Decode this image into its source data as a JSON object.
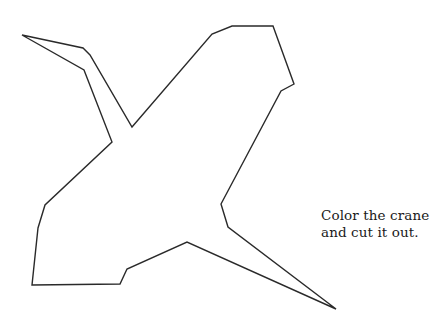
{
  "worksheet": {
    "instructions": {
      "line1": "Color the crane",
      "line2": "and cut it out."
    },
    "crane": {
      "stroke_color": "#2a2a2a",
      "fill_color": "none",
      "outline_points": "22,35 83,48 90,55 132,127 212,34 232,26 273,26 294,84 281,91 221,204 228,227 336,309 187,242 127,269 120,284 32,285 38,228 45,205 112,142 84,70 22,35"
    }
  }
}
